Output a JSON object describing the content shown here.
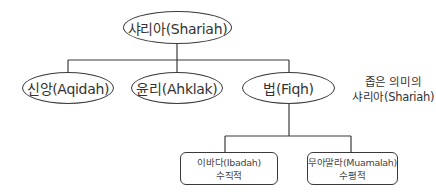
{
  "diagram": {
    "type": "hierarchy-tree",
    "root": {
      "label": "샤리아(Shariah)"
    },
    "level1": [
      {
        "label": "신앙(Aqidah)"
      },
      {
        "label": "윤리(Ahklak)"
      },
      {
        "label": "법(Fiqh)"
      }
    ],
    "note": {
      "line1": "좁은 의미의",
      "line2": "샤리아(Shariah)"
    },
    "level2": [
      {
        "title": "이바다(Ibadah)",
        "subtitle": "수직적"
      },
      {
        "title": "무아말라(Muamalah)",
        "subtitle": "수평적"
      }
    ],
    "colors": {
      "stroke": "#3a3a3a",
      "text": "#333333",
      "background": "#ffffff"
    }
  }
}
